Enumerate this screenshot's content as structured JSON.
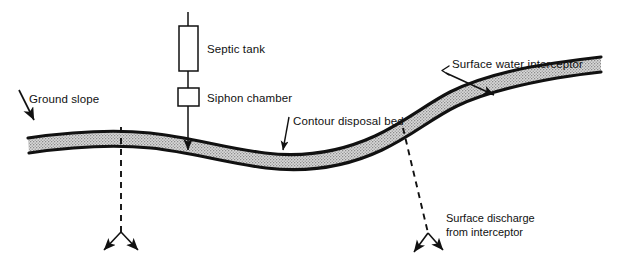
{
  "figure": {
    "type": "engineering-cross-section",
    "background_color": "#ffffff",
    "ink_color": "#111111",
    "band_fill_color": "#cccccc",
    "band_edge_color": "#111111"
  },
  "labels": {
    "ground_slope": "Ground slope",
    "septic_tank": "Septic tank",
    "siphon_chamber": "Siphon chamber",
    "contour_disposal_bed": "Contour disposal bed",
    "surface_water_interceptor": "Surface water interceptor",
    "surface_discharge_line1": "Surface discharge",
    "surface_discharge_line2": "from interceptor"
  },
  "components": {
    "septic_tank_shape": "tall-rectangle",
    "siphon_chamber_shape": "small-square",
    "pipe": "vertical-line",
    "ground_band": "stippled-ribbon",
    "seepage_indicator": "dashed-line-with-double-arrow",
    "discharge_indicator": "dashed-line-with-double-arrow"
  },
  "icon_names": {
    "leader_arrow": "arrow-icon",
    "double_arrow": "double-arrow-icon",
    "caret_marker": "caret-left-icon"
  }
}
